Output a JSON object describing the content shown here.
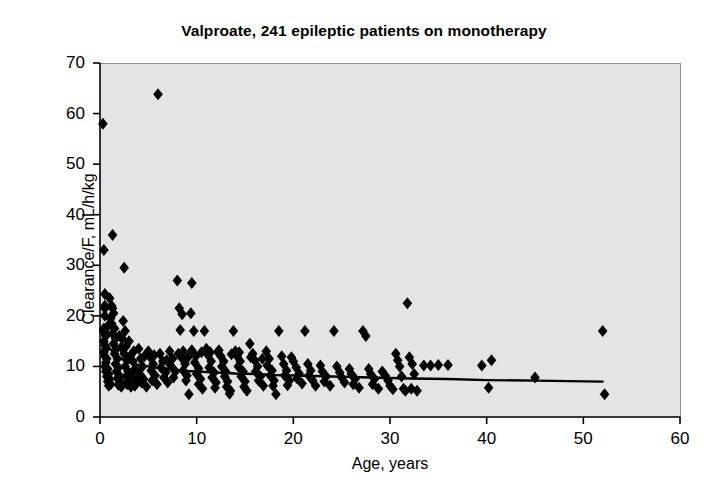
{
  "chart_data": {
    "type": "scatter",
    "title": "Valproate, 241 epileptic patients on monotherapy",
    "xlabel": "Age, years",
    "ylabel": "Clearance/F, mL/h/kg",
    "xlim": [
      0,
      60
    ],
    "ylim": [
      0,
      70
    ],
    "xticks": [
      0,
      10,
      20,
      30,
      40,
      50,
      60
    ],
    "yticks": [
      0,
      10,
      20,
      30,
      40,
      50,
      60,
      70
    ],
    "grid": false,
    "legend": null,
    "plot_background_color": "#e4e4e4",
    "marker": {
      "shape": "diamond",
      "color": "#000000",
      "size": 6
    },
    "series": [
      {
        "name": "Patients",
        "n_points": 241,
        "points": [
          [
            0.3,
            58.0
          ],
          [
            0.4,
            33.0
          ],
          [
            0.5,
            24.3
          ],
          [
            0.5,
            22.0
          ],
          [
            0.5,
            21.5
          ],
          [
            0.5,
            20.0
          ],
          [
            0.4,
            17.5
          ],
          [
            0.5,
            16.8
          ],
          [
            0.6,
            16.0
          ],
          [
            0.4,
            15.0
          ],
          [
            0.5,
            14.2
          ],
          [
            0.6,
            13.5
          ],
          [
            0.4,
            12.8
          ],
          [
            0.5,
            12.0
          ],
          [
            0.7,
            11.5
          ],
          [
            0.6,
            10.8
          ],
          [
            0.5,
            10.0
          ],
          [
            0.8,
            9.5
          ],
          [
            0.6,
            9.0
          ],
          [
            0.9,
            8.5
          ],
          [
            0.7,
            8.0
          ],
          [
            1.0,
            7.5
          ],
          [
            0.8,
            7.0
          ],
          [
            1.1,
            6.5
          ],
          [
            0.9,
            6.2
          ],
          [
            1.3,
            36.0
          ],
          [
            1.2,
            22.0
          ],
          [
            1.3,
            21.5
          ],
          [
            1.4,
            20.5
          ],
          [
            1.2,
            18.5
          ],
          [
            1.5,
            17.5
          ],
          [
            1.3,
            16.5
          ],
          [
            1.6,
            15.5
          ],
          [
            1.4,
            14.5
          ],
          [
            1.7,
            13.5
          ],
          [
            1.5,
            12.5
          ],
          [
            1.8,
            11.5
          ],
          [
            1.6,
            10.5
          ],
          [
            1.9,
            9.8
          ],
          [
            1.7,
            9.0
          ],
          [
            2.0,
            8.2
          ],
          [
            1.8,
            7.6
          ],
          [
            2.1,
            7.0
          ],
          [
            1.9,
            6.4
          ],
          [
            2.2,
            6.0
          ],
          [
            2.5,
            29.5
          ],
          [
            2.4,
            19.0
          ],
          [
            2.6,
            17.0
          ],
          [
            2.3,
            15.5
          ],
          [
            2.7,
            14.0
          ],
          [
            2.5,
            12.5
          ],
          [
            2.8,
            11.2
          ],
          [
            2.6,
            10.0
          ],
          [
            2.9,
            9.0
          ],
          [
            2.7,
            8.0
          ],
          [
            3.0,
            7.2
          ],
          [
            2.8,
            6.5
          ],
          [
            3.2,
            6.0
          ],
          [
            3.5,
            13.0
          ],
          [
            3.4,
            11.0
          ],
          [
            3.6,
            9.5
          ],
          [
            3.3,
            8.0
          ],
          [
            3.8,
            7.0
          ],
          [
            3.6,
            6.2
          ],
          [
            4.0,
            13.5
          ],
          [
            4.2,
            11.5
          ],
          [
            4.4,
            10.0
          ],
          [
            4.1,
            8.5
          ],
          [
            4.5,
            7.5
          ],
          [
            4.3,
            6.8
          ],
          [
            4.8,
            6.0
          ],
          [
            5.0,
            13.0
          ],
          [
            5.2,
            11.8
          ],
          [
            5.5,
            10.5
          ],
          [
            5.3,
            9.2
          ],
          [
            5.7,
            8.2
          ],
          [
            5.4,
            7.2
          ],
          [
            5.9,
            6.5
          ],
          [
            6.0,
            63.8
          ],
          [
            6.2,
            12.5
          ],
          [
            6.5,
            11.0
          ],
          [
            6.3,
            9.8
          ],
          [
            6.8,
            8.8
          ],
          [
            6.6,
            7.8
          ],
          [
            7.0,
            6.8
          ],
          [
            7.2,
            13.0
          ],
          [
            7.5,
            11.5
          ],
          [
            7.3,
            10.2
          ],
          [
            7.8,
            9.0
          ],
          [
            7.6,
            7.8
          ],
          [
            8.0,
            27.0
          ],
          [
            8.2,
            21.5
          ],
          [
            8.5,
            20.3
          ],
          [
            8.3,
            17.2
          ],
          [
            8.6,
            13.0
          ],
          [
            8.4,
            11.8
          ],
          [
            8.8,
            10.5
          ],
          [
            8.6,
            9.2
          ],
          [
            9.0,
            8.2
          ],
          [
            8.9,
            7.2
          ],
          [
            9.2,
            4.5
          ],
          [
            9.5,
            26.5
          ],
          [
            9.4,
            20.5
          ],
          [
            9.7,
            17.0
          ],
          [
            9.5,
            13.2
          ],
          [
            9.9,
            12.0
          ],
          [
            9.8,
            10.8
          ],
          [
            10.2,
            9.6
          ],
          [
            10.0,
            8.5
          ],
          [
            10.4,
            7.5
          ],
          [
            10.2,
            6.5
          ],
          [
            10.6,
            5.6
          ],
          [
            10.8,
            17.0
          ],
          [
            11.0,
            13.5
          ],
          [
            11.2,
            12.2
          ],
          [
            11.5,
            11.0
          ],
          [
            11.3,
            9.8
          ],
          [
            11.8,
            8.8
          ],
          [
            11.6,
            7.8
          ],
          [
            12.0,
            6.8
          ],
          [
            11.9,
            5.8
          ],
          [
            12.3,
            13.2
          ],
          [
            12.5,
            12.0
          ],
          [
            12.8,
            11.0
          ],
          [
            12.6,
            10.0
          ],
          [
            13.0,
            9.0
          ],
          [
            12.9,
            8.0
          ],
          [
            13.2,
            7.0
          ],
          [
            13.1,
            6.0
          ],
          [
            13.5,
            5.2
          ],
          [
            13.4,
            4.6
          ],
          [
            13.8,
            17.0
          ],
          [
            14.0,
            13.0
          ],
          [
            14.2,
            12.0
          ],
          [
            14.5,
            11.0
          ],
          [
            14.3,
            10.0
          ],
          [
            14.8,
            9.0
          ],
          [
            14.6,
            8.0
          ],
          [
            15.0,
            7.0
          ],
          [
            14.9,
            6.0
          ],
          [
            15.2,
            5.2
          ],
          [
            15.5,
            14.5
          ],
          [
            15.8,
            12.5
          ],
          [
            16.0,
            11.2
          ],
          [
            16.3,
            10.0
          ],
          [
            16.1,
            9.0
          ],
          [
            16.6,
            8.0
          ],
          [
            16.4,
            7.2
          ],
          [
            16.9,
            6.2
          ],
          [
            17.2,
            13.0
          ],
          [
            17.5,
            11.5
          ],
          [
            17.3,
            10.2
          ],
          [
            17.8,
            9.2
          ],
          [
            17.6,
            8.2
          ],
          [
            18.0,
            7.2
          ],
          [
            17.9,
            6.2
          ],
          [
            18.2,
            4.5
          ],
          [
            18.5,
            17.0
          ],
          [
            18.8,
            12.0
          ],
          [
            19.0,
            10.5
          ],
          [
            19.3,
            9.2
          ],
          [
            19.1,
            8.2
          ],
          [
            19.6,
            7.2
          ],
          [
            19.4,
            6.3
          ],
          [
            20.0,
            11.0
          ],
          [
            20.3,
            9.8
          ],
          [
            20.6,
            8.6
          ],
          [
            20.4,
            7.6
          ],
          [
            20.9,
            6.6
          ],
          [
            21.2,
            17.0
          ],
          [
            21.5,
            10.5
          ],
          [
            21.8,
            9.2
          ],
          [
            21.6,
            8.2
          ],
          [
            22.0,
            7.2
          ],
          [
            22.3,
            6.2
          ],
          [
            22.8,
            10.2
          ],
          [
            23.0,
            9.0
          ],
          [
            23.4,
            8.0
          ],
          [
            23.2,
            7.0
          ],
          [
            23.8,
            6.2
          ],
          [
            24.2,
            17.0
          ],
          [
            24.5,
            10.0
          ],
          [
            24.8,
            8.8
          ],
          [
            25.0,
            7.8
          ],
          [
            25.3,
            6.8
          ],
          [
            25.8,
            9.5
          ],
          [
            26.0,
            8.5
          ],
          [
            26.4,
            7.5
          ],
          [
            26.2,
            6.5
          ],
          [
            26.8,
            5.8
          ],
          [
            27.2,
            17.0
          ],
          [
            27.5,
            16.0
          ],
          [
            27.8,
            9.5
          ],
          [
            28.0,
            8.5
          ],
          [
            28.4,
            7.5
          ],
          [
            28.2,
            6.5
          ],
          [
            28.8,
            5.6
          ],
          [
            29.2,
            9.0
          ],
          [
            29.5,
            8.2
          ],
          [
            29.8,
            7.2
          ],
          [
            30.0,
            6.2
          ],
          [
            30.3,
            5.5
          ],
          [
            30.6,
            12.5
          ],
          [
            30.8,
            11.2
          ],
          [
            31.0,
            10.0
          ],
          [
            31.2,
            8.0
          ],
          [
            31.4,
            5.6
          ],
          [
            31.6,
            5.2
          ],
          [
            31.8,
            22.5
          ],
          [
            32.0,
            11.8
          ],
          [
            32.3,
            10.5
          ],
          [
            32.5,
            8.5
          ],
          [
            32.2,
            5.6
          ],
          [
            32.8,
            5.2
          ],
          [
            33.5,
            10.2
          ],
          [
            34.2,
            10.2
          ],
          [
            35.0,
            10.3
          ],
          [
            36.0,
            10.3
          ],
          [
            39.5,
            10.2
          ],
          [
            40.5,
            11.2
          ],
          [
            40.2,
            5.8
          ],
          [
            45.0,
            7.8
          ],
          [
            52.0,
            17.0
          ],
          [
            52.2,
            4.5
          ],
          [
            1.0,
            23.5
          ],
          [
            1.1,
            19.5
          ],
          [
            0.9,
            18.2
          ],
          [
            2.0,
            16.0
          ],
          [
            2.2,
            13.8
          ],
          [
            3.0,
            15.0
          ],
          [
            3.1,
            12.0
          ],
          [
            4.6,
            12.0
          ],
          [
            5.6,
            12.2
          ],
          [
            6.9,
            11.2
          ],
          [
            8.1,
            12.5
          ],
          [
            9.1,
            11.8
          ],
          [
            10.5,
            12.8
          ],
          [
            11.4,
            12.8
          ],
          [
            12.2,
            12.8
          ],
          [
            13.6,
            12.4
          ],
          [
            14.4,
            12.8
          ],
          [
            15.6,
            11.8
          ],
          [
            16.8,
            11.5
          ],
          [
            19.8,
            11.8
          ]
        ]
      }
    ],
    "trendline": {
      "name": "Fitted clearance vs age",
      "color": "#000000",
      "width": 2.4,
      "points": [
        [
          0.0,
          17.2
        ],
        [
          0.3,
          16.0
        ],
        [
          0.6,
          14.8
        ],
        [
          1.0,
          13.6
        ],
        [
          1.4,
          12.7
        ],
        [
          1.8,
          12.0
        ],
        [
          2.3,
          11.4
        ],
        [
          2.8,
          11.0
        ],
        [
          3.4,
          10.6
        ],
        [
          4.0,
          10.3
        ],
        [
          5.0,
          10.0
        ],
        [
          6.0,
          9.7
        ],
        [
          7.0,
          9.5
        ],
        [
          8.0,
          9.3
        ],
        [
          9.0,
          9.1
        ],
        [
          10.0,
          9.0
        ],
        [
          12.0,
          8.8
        ],
        [
          14.0,
          8.6
        ],
        [
          16.0,
          8.5
        ],
        [
          18.0,
          8.3
        ],
        [
          20.0,
          8.2
        ],
        [
          24.0,
          8.0
        ],
        [
          28.0,
          7.8
        ],
        [
          32.0,
          7.6
        ],
        [
          36.0,
          7.5
        ],
        [
          40.0,
          7.3
        ],
        [
          45.0,
          7.2
        ],
        [
          52.0,
          7.0
        ]
      ]
    }
  }
}
